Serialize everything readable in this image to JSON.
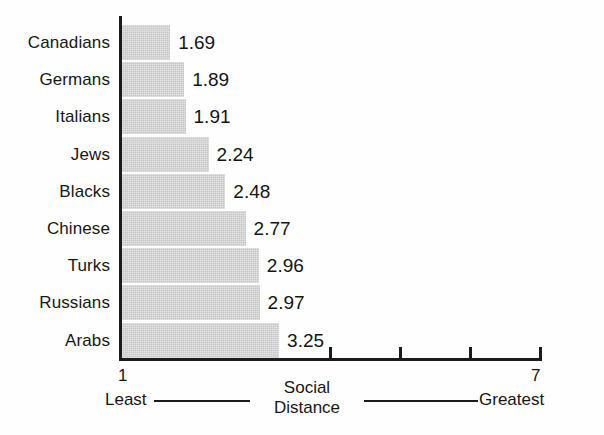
{
  "chart_data": {
    "type": "bar",
    "orientation": "horizontal",
    "title": "",
    "xlabel": "Social Distance",
    "ylabel": "",
    "xlim": [
      1,
      7
    ],
    "grid": false,
    "legend": null,
    "bar_base_value": 1,
    "categories": [
      "Canadians",
      "Germans",
      "Italians",
      "Jews",
      "Blacks",
      "Chinese",
      "Turks",
      "Russians",
      "Arabs"
    ],
    "values": [
      1.69,
      1.89,
      1.91,
      2.24,
      2.48,
      2.77,
      2.96,
      2.97,
      3.25
    ],
    "value_labels": [
      "1.69",
      "1.89",
      "1.91",
      "2.24",
      "2.48",
      "2.77",
      "2.96",
      "2.97",
      "3.25"
    ],
    "xticks": [
      1,
      2,
      3,
      4,
      5,
      6,
      7
    ],
    "xtick_labels_shown": [
      "1",
      "7"
    ],
    "axis_endpoints": {
      "left_number": "1",
      "left_word": "Least",
      "right_number": "7",
      "right_word": "Greatest"
    },
    "axis_center_label_line1": "Social",
    "axis_center_label_line2": "Distance",
    "bar_fill_color": "#c6c6c6",
    "axis_color": "#1b1b1b",
    "text_color": "#161616",
    "background_color": "#ffffff"
  }
}
